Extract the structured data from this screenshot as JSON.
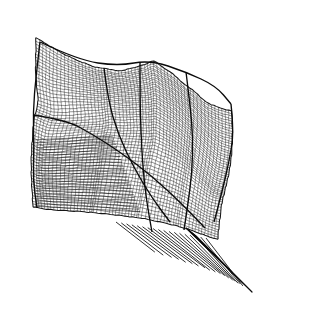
{
  "figure": {
    "type": "wireframe-surface-plot",
    "background_color": "#ffffff",
    "line_color": "#000000",
    "frame_color": "#5d5d5d",
    "frame": {
      "x": 10,
      "y": 9,
      "width": 304,
      "height": 298
    },
    "caption": "",
    "title": "",
    "axis_labels": []
  },
  "chart_data": {
    "type": "line",
    "title": "",
    "subtitle": "",
    "xlabel": "",
    "ylabel": "",
    "grid": false,
    "legend": [],
    "annotations": [],
    "render": {
      "projection": "oblique-parallel",
      "u_count": 58,
      "v_count": 54,
      "stroke_width": 0.55,
      "stroke_color": "#0a0a0a",
      "stroke_alpha": 0.92
    },
    "surface_outline": [
      [
        40,
        42
      ],
      [
        70,
        58
      ],
      [
        104,
        68
      ],
      [
        140,
        62
      ],
      [
        178,
        70
      ],
      [
        212,
        82
      ],
      [
        231,
        104
      ],
      [
        233,
        132
      ],
      [
        228,
        160
      ],
      [
        222,
        190
      ],
      [
        214,
        222
      ],
      [
        196,
        236
      ],
      [
        160,
        240
      ],
      [
        120,
        232
      ],
      [
        86,
        224
      ],
      [
        56,
        216
      ],
      [
        36,
        206
      ],
      [
        30,
        176
      ],
      [
        33,
        144
      ],
      [
        31,
        112
      ],
      [
        36,
        74
      ]
    ],
    "ridge_lines": [
      {
        "name": "top-ridge",
        "points": [
          [
            40,
            42
          ],
          [
            78,
            60
          ],
          [
            118,
            66
          ],
          [
            150,
            60
          ],
          [
            186,
            72
          ],
          [
            216,
            86
          ],
          [
            231,
            104
          ]
        ]
      },
      {
        "name": "mid-crease",
        "points": [
          [
            33,
            115
          ],
          [
            66,
            120
          ],
          [
            92,
            134
          ],
          [
            120,
            152
          ],
          [
            152,
            176
          ],
          [
            182,
            204
          ],
          [
            205,
            228
          ]
        ]
      },
      {
        "name": "left-fold",
        "points": [
          [
            40,
            42
          ],
          [
            36,
            76
          ],
          [
            33,
            112
          ],
          [
            34,
            148
          ],
          [
            33,
            180
          ],
          [
            37,
            208
          ]
        ]
      },
      {
        "name": "right-fold",
        "points": [
          [
            231,
            104
          ],
          [
            234,
            132
          ],
          [
            229,
            162
          ],
          [
            222,
            192
          ],
          [
            214,
            222
          ]
        ]
      },
      {
        "name": "inner-valley",
        "points": [
          [
            104,
            68
          ],
          [
            108,
            100
          ],
          [
            118,
            134
          ],
          [
            134,
            168
          ],
          [
            152,
            198
          ],
          [
            170,
            222
          ]
        ]
      },
      {
        "name": "column-a",
        "points": [
          [
            140,
            62
          ],
          [
            140,
            98
          ],
          [
            141,
            134
          ],
          [
            143,
            170
          ],
          [
            147,
            204
          ],
          [
            152,
            232
          ]
        ]
      },
      {
        "name": "column-b",
        "points": [
          [
            186,
            72
          ],
          [
            190,
            104
          ],
          [
            193,
            138
          ],
          [
            192,
            172
          ],
          [
            188,
            204
          ],
          [
            184,
            230
          ]
        ]
      }
    ],
    "tail": {
      "name": "lower-right-fan",
      "apex": [
        246,
        288
      ],
      "fan_origin_edge": [
        [
          116,
          222
        ],
        [
          206,
          238
        ]
      ],
      "ray_count": 17,
      "ribbon": [
        [
          186,
          228
        ],
        [
          246,
          286
        ],
        [
          252,
          292
        ],
        [
          196,
          236
        ]
      ]
    },
    "left_stripe_panel": {
      "name": "left-horizontal-stripes",
      "region": [
        [
          36,
          140
        ],
        [
          96,
          146
        ],
        [
          92,
          212
        ],
        [
          36,
          206
        ]
      ],
      "line_count": 26,
      "orientation": "near-horizontal"
    },
    "series": [
      {
        "name": "u-isolines",
        "count": 58
      },
      {
        "name": "v-isolines",
        "count": 54
      }
    ]
  }
}
